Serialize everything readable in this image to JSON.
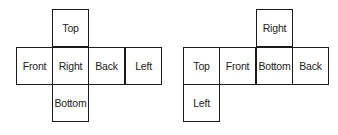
{
  "diagram": {
    "type": "cube-nets",
    "nets": [
      {
        "id": "net-1",
        "faces": [
          {
            "label": "Top",
            "col": 1,
            "row": 0
          },
          {
            "label": "Front",
            "col": 0,
            "row": 1
          },
          {
            "label": "Right",
            "col": 1,
            "row": 1
          },
          {
            "label": "Back",
            "col": 2,
            "row": 1
          },
          {
            "label": "Left",
            "col": 3,
            "row": 1
          },
          {
            "label": "Bottom",
            "col": 1,
            "row": 2
          }
        ]
      },
      {
        "id": "net-2",
        "faces": [
          {
            "label": "Right",
            "col": 2,
            "row": 0
          },
          {
            "label": "Top",
            "col": 0,
            "row": 1
          },
          {
            "label": "Front",
            "col": 1,
            "row": 1
          },
          {
            "label": "Bottom",
            "col": 2,
            "row": 1
          },
          {
            "label": "Back",
            "col": 3,
            "row": 1
          },
          {
            "label": "Left",
            "col": 0,
            "row": 2
          }
        ]
      }
    ]
  }
}
